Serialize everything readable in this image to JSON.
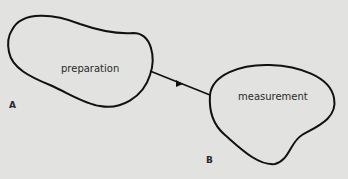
{
  "diagram": {
    "nodes": [
      {
        "id": "preparation",
        "label": "preparation"
      },
      {
        "id": "measurement",
        "label": "measurement"
      }
    ],
    "points": [
      {
        "id": "A",
        "label": "A"
      },
      {
        "id": "B",
        "label": "B"
      }
    ],
    "edges": [
      {
        "from": "preparation",
        "to": "measurement",
        "type": "arrow"
      }
    ],
    "colors": {
      "background": "#e2e2e0",
      "stroke": "#111111",
      "text": "#2a2a2a"
    }
  }
}
